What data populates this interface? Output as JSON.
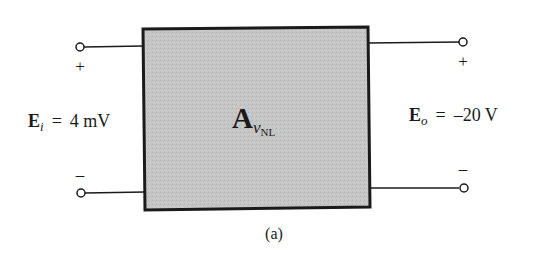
{
  "diagram": {
    "caption": "(a)",
    "block": {
      "symbol": "A",
      "subscript_var": "v",
      "subscript_tag": "NL",
      "fill": "#c6c6c6",
      "stroke": "#1a1a1a"
    },
    "input": {
      "symbol": "E",
      "subscript": "i",
      "equals": "=",
      "value": "4 mV",
      "plus": "+",
      "minus": "–"
    },
    "output": {
      "symbol": "E",
      "subscript": "o",
      "equals": "=",
      "value": "–20 V",
      "plus": "+",
      "minus": "–"
    }
  }
}
